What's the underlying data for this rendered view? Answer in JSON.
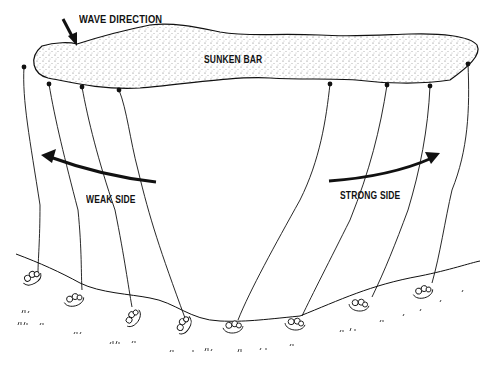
{
  "diagram": {
    "labels": {
      "wave_direction": "WAVE DIRECTION",
      "sunken_bar": "SUNKEN BAR",
      "weak_side": "WEAK SIDE",
      "strong_side": "STRONG SIDE"
    },
    "colors": {
      "ink": "#111111",
      "background": "#ffffff",
      "stipple": "#555555"
    },
    "anchors": [
      {
        "x": 24,
        "y": 67
      },
      {
        "x": 49,
        "y": 84
      },
      {
        "x": 82,
        "y": 87
      },
      {
        "x": 119,
        "y": 90
      },
      {
        "x": 330,
        "y": 84
      },
      {
        "x": 387,
        "y": 85
      },
      {
        "x": 430,
        "y": 86
      },
      {
        "x": 468,
        "y": 64
      }
    ],
    "rafts": [
      {
        "x": 32,
        "y": 278
      },
      {
        "x": 80,
        "y": 297
      },
      {
        "x": 135,
        "y": 316
      },
      {
        "x": 186,
        "y": 326
      },
      {
        "x": 234,
        "y": 328
      },
      {
        "x": 296,
        "y": 322
      },
      {
        "x": 360,
        "y": 303
      },
      {
        "x": 422,
        "y": 290
      }
    ]
  }
}
